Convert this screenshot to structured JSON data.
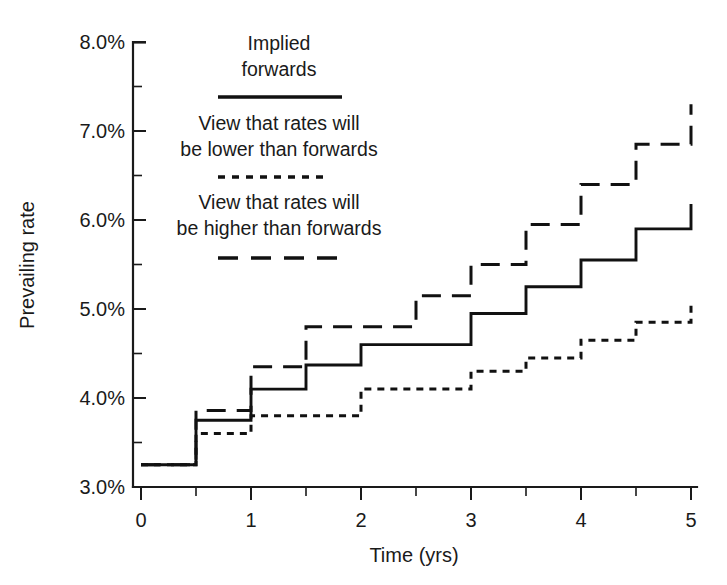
{
  "chart_data": {
    "type": "line",
    "title": "",
    "subtitle": "",
    "xlabel": "Time (yrs)",
    "ylabel": "Prevailing rate",
    "xlim": [
      0,
      5
    ],
    "ylim": [
      3.0,
      8.0
    ],
    "grid": false,
    "step_style": "post",
    "step_width": 0.5,
    "x_ticks_major": [
      0,
      1,
      2,
      3,
      4,
      5
    ],
    "x_tick_labels": [
      "0",
      "1",
      "2",
      "3",
      "4",
      "5"
    ],
    "x_ticks_minor": [
      0.5,
      1.5,
      2.5,
      3.5,
      4.5
    ],
    "y_ticks_major": [
      3.0,
      4.0,
      5.0,
      6.0,
      7.0,
      8.0
    ],
    "y_tick_labels": [
      "3.0%",
      "4.0%",
      "5.0%",
      "6.0%",
      "7.0%",
      "8.0%"
    ],
    "y_ticks_minor": [
      3.5,
      4.5,
      5.5,
      6.5,
      7.5
    ],
    "legend_position": "upper-left-inside",
    "x_step_starts": [
      0,
      0.5,
      1,
      1.5,
      2,
      2.5,
      3,
      3.5,
      4,
      4.5
    ],
    "series": [
      {
        "name": "Implied forwards",
        "style": "solid",
        "values": [
          3.25,
          3.75,
          4.1,
          4.37,
          4.6,
          4.6,
          4.95,
          5.25,
          5.55,
          5.9,
          6.18
        ]
      },
      {
        "name": "View that rates will be lower than forwards",
        "style": "dotted",
        "values": [
          3.25,
          3.6,
          3.8,
          3.8,
          4.1,
          4.1,
          4.3,
          4.45,
          4.65,
          4.85,
          5.07
        ]
      },
      {
        "name": "View that rates will be higher than forwards",
        "style": "dashed",
        "values": [
          3.25,
          3.86,
          4.35,
          4.8,
          4.8,
          5.15,
          5.5,
          5.95,
          6.4,
          6.85,
          7.3
        ]
      }
    ]
  },
  "axes": {
    "y_label": "Prevailing rate",
    "x_label": "Time (yrs)",
    "y_tick_0": "3.0%",
    "y_tick_1": "4.0%",
    "y_tick_2": "5.0%",
    "y_tick_3": "6.0%",
    "y_tick_4": "7.0%",
    "y_tick_5": "8.0%",
    "x_tick_0": "0",
    "x_tick_1": "1",
    "x_tick_2": "2",
    "x_tick_3": "3",
    "x_tick_4": "4",
    "x_tick_5": "5"
  },
  "legend": {
    "entries": [
      {
        "line1": "Implied",
        "line2": "forwards",
        "style": "solid"
      },
      {
        "line1": "View that rates will",
        "line2": "be lower than forwards",
        "style": "dotted"
      },
      {
        "line1": "View that rates will",
        "line2": "be higher than forwards",
        "style": "dashed"
      }
    ]
  },
  "colors": {
    "ink": "#111111",
    "background": "#ffffff"
  }
}
